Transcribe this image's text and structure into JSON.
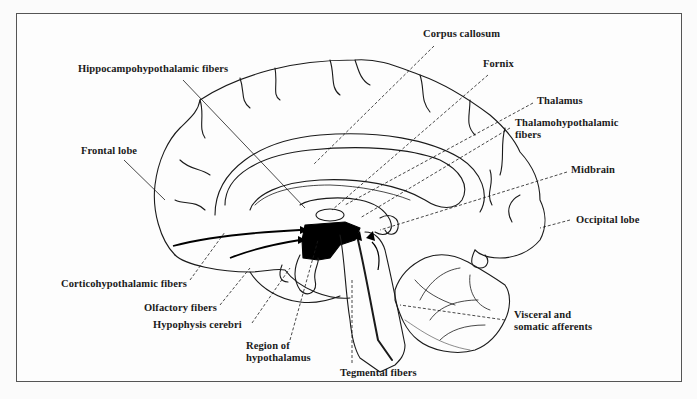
{
  "figure": {
    "colors": {
      "ink": "#1a1a1a",
      "frame": "#555555",
      "background": "#fdfdfd",
      "nucleus_fill": "#000000"
    }
  },
  "labels": {
    "corpus_callosum": "Corpus callosum",
    "hippocampohypothalamic": "Hippocampohypothalamic fibers",
    "fornix": "Fornix",
    "thalamus": "Thalamus",
    "thalamohypothalamic_1": "Thalamohypothalamic",
    "thalamohypothalamic_2": "fibers",
    "frontal_lobe": "Frontal lobe",
    "midbrain": "Midbrain",
    "occipital_lobe": "Occipital lobe",
    "corticohypothalamic": "Corticohypothalamic fibers",
    "olfactory": "Olfactory fibers",
    "hypophysis": "Hypophysis cerebri",
    "region_1": "Region of",
    "region_2": "hypothalamus",
    "visceral_1": "Visceral and",
    "visceral_2": "somatic afferents",
    "tegmental": "Tegmental fibers"
  }
}
